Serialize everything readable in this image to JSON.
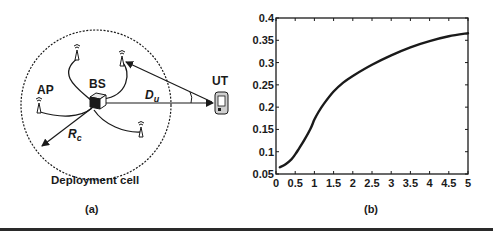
{
  "panel_a": {
    "caption": "(a)",
    "labels": {
      "ap": "AP",
      "bs": "BS",
      "ut": "UT",
      "du_main": "D",
      "du_sub": "u",
      "rc_main": "R",
      "rc_sub": "c",
      "cell": "Deployment cell"
    }
  },
  "panel_b": {
    "caption": "(b)"
  },
  "colors": {
    "ink": "#1a1a1a",
    "background": "#ffffff"
  },
  "chart_data": {
    "type": "line",
    "title": "",
    "xlabel": "",
    "ylabel": "",
    "xlim": [
      0,
      5
    ],
    "ylim": [
      0.05,
      0.4
    ],
    "grid": false,
    "legend": null,
    "x_ticks": [
      "0",
      "0.5",
      "1",
      "1.5",
      "2",
      "2.5",
      "3",
      "3.5",
      "4",
      "4.5",
      "5"
    ],
    "y_ticks": [
      "0.05",
      "0.1",
      "0.15",
      "0.2",
      "0.25",
      "0.3",
      "0.35",
      "0.4"
    ],
    "series": [
      {
        "name": "curve",
        "x": [
          0.1,
          0.25,
          0.4,
          0.5,
          0.6,
          0.75,
          0.9,
          1.0,
          1.1,
          1.25,
          1.5,
          1.75,
          2.0,
          2.5,
          3.0,
          3.5,
          4.0,
          4.5,
          5.0
        ],
        "y": [
          0.065,
          0.072,
          0.083,
          0.094,
          0.107,
          0.128,
          0.152,
          0.172,
          0.188,
          0.208,
          0.235,
          0.255,
          0.27,
          0.295,
          0.316,
          0.334,
          0.348,
          0.359,
          0.366
        ]
      }
    ]
  }
}
